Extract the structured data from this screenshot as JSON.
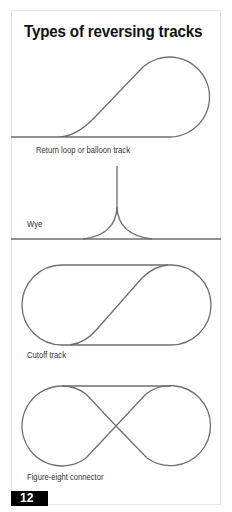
{
  "page": {
    "title": "Types of reversing tracks",
    "page_number": "12"
  },
  "diagrams": [
    {
      "id": "return-loop",
      "caption": "Return loop or balloon track"
    },
    {
      "id": "wye",
      "caption": "Wye"
    },
    {
      "id": "cutoff",
      "caption": "Cutoff track"
    },
    {
      "id": "figure-eight",
      "caption": "Figure-eight connector"
    }
  ],
  "colors": {
    "track": "#6e6e6e",
    "frame": "#e0e0e0",
    "badge_bg": "#000000",
    "badge_text": "#ffffff"
  }
}
